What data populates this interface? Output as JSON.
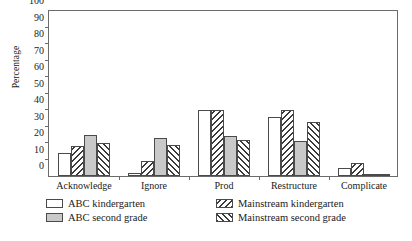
{
  "chart_data": {
    "type": "bar",
    "title": "",
    "xlabel": "",
    "ylabel": "Percentage",
    "ylim": [
      0,
      100
    ],
    "yticks": [
      0,
      10,
      20,
      30,
      40,
      50,
      60,
      70,
      80,
      90,
      100
    ],
    "grid": false,
    "legend_position": "below-axes",
    "categories": [
      "Acknowledge",
      "Ignore",
      "Prod",
      "Restructure",
      "Complicate"
    ],
    "series": [
      {
        "name": "ABC kindergarten",
        "pattern": "solid-white",
        "color": "#ffffff",
        "values": [
          14,
          2,
          40,
          36,
          5
        ]
      },
      {
        "name": "Mainstream kindergarten",
        "pattern": "backslash-hatch",
        "color": "#3a3a3a",
        "values": [
          18,
          9,
          40,
          40,
          8
        ]
      },
      {
        "name": "ABC second grade",
        "pattern": "solid-gray",
        "color": "#c9c9c9",
        "values": [
          25,
          23,
          24,
          21,
          0
        ]
      },
      {
        "name": "Mainstream second grade",
        "pattern": "forwardslash-hatch",
        "color": "#3a3a3a",
        "values": [
          20,
          19,
          22,
          33,
          1
        ]
      }
    ]
  },
  "legend": {
    "entries": [
      {
        "label": "ABC kindergarten",
        "swatch": "white-swatch"
      },
      {
        "label": "Mainstream kindergarten",
        "swatch": "backslash-swatch"
      },
      {
        "label": "ABC second grade",
        "swatch": "gray-swatch"
      },
      {
        "label": "Mainstream second grade",
        "swatch": "forwardslash-swatch"
      }
    ]
  }
}
